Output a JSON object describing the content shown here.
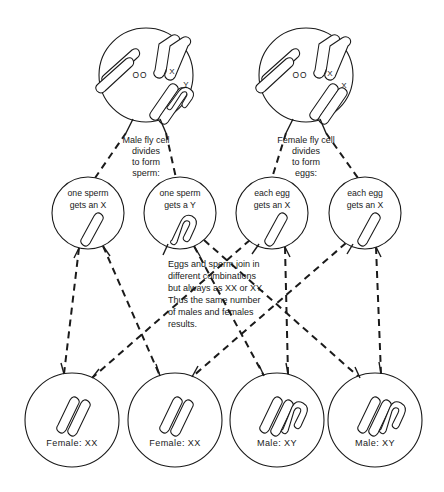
{
  "diagram": {
    "colors": {
      "ink": "#1a1a1a",
      "background": "#ffffff"
    },
    "parent_cells": [
      {
        "id": "male-parent",
        "caption_lines": [
          "Male fly cell",
          "divides",
          "to form",
          "sperm:"
        ],
        "autosome_label": "OO",
        "sex_marks": [
          "X",
          "Y"
        ]
      },
      {
        "id": "female-parent",
        "caption_lines": [
          "Female fly cell",
          "divides",
          "to form",
          "eggs:"
        ],
        "autosome_label": "OO",
        "sex_marks": [
          "X",
          "X"
        ]
      }
    ],
    "gametes": [
      {
        "id": "sperm-x",
        "line1": "one sperm",
        "line2": "gets an X",
        "chromosome": "X"
      },
      {
        "id": "sperm-y",
        "line1": "one sperm",
        "line2": "gets a Y",
        "chromosome": "Y"
      },
      {
        "id": "egg-x-1",
        "line1": "each egg",
        "line2": "gets an X",
        "chromosome": "X"
      },
      {
        "id": "egg-x-2",
        "line1": "each egg",
        "line2": "gets an X",
        "chromosome": "X"
      }
    ],
    "explanation_lines": [
      "Eggs and sperm join in",
      "different combinations",
      "but always as XX or XY.",
      "Thus the same number",
      "of males and females",
      "results."
    ],
    "offspring": [
      {
        "id": "offspring-1",
        "label": "Female:  XX",
        "sex": "Female",
        "genotype": "XX"
      },
      {
        "id": "offspring-2",
        "label": "Female:  XX",
        "sex": "Female",
        "genotype": "XX"
      },
      {
        "id": "offspring-3",
        "label": "Male:  XY",
        "sex": "Male",
        "genotype": "XY"
      },
      {
        "id": "offspring-4",
        "label": "Male:  XY",
        "sex": "Male",
        "genotype": "XY"
      }
    ]
  }
}
